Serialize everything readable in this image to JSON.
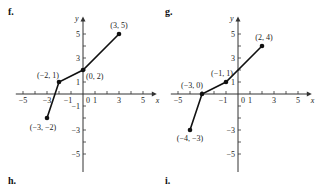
{
  "labels": {
    "f": "f.",
    "g": "g.",
    "h": "h.",
    "i": "i."
  },
  "chart_data": [
    {
      "type": "line",
      "title": "f.",
      "xlabel": "x",
      "ylabel": "y",
      "xlim": [
        -5,
        5
      ],
      "ylim": [
        -5,
        5
      ],
      "x_ticks": [
        -5,
        -3,
        -1,
        0,
        1,
        3,
        5
      ],
      "y_ticks": [
        -5,
        -3,
        -1,
        1,
        3,
        5
      ],
      "grid": false,
      "points": [
        [
          -3,
          -2
        ],
        [
          -2,
          1
        ],
        [
          0,
          2
        ],
        [
          3,
          5
        ]
      ],
      "point_labels": [
        "(−3, −2)",
        "(−2, 1)",
        "(0, 2)",
        "(3, 5)"
      ]
    },
    {
      "type": "line",
      "title": "g.",
      "xlabel": "x",
      "ylabel": "y",
      "xlim": [
        -5,
        5
      ],
      "ylim": [
        -5,
        5
      ],
      "x_ticks": [
        -5,
        -1,
        0,
        1,
        3,
        5
      ],
      "y_ticks": [
        -5,
        -3,
        1,
        3,
        5
      ],
      "grid": false,
      "points": [
        [
          -4,
          -3
        ],
        [
          -3,
          0
        ],
        [
          -1,
          1
        ],
        [
          2,
          4
        ]
      ],
      "point_labels": [
        "(−4, −3)",
        "(−3, 0)",
        "(−1, 1)",
        "(2, 4)"
      ]
    }
  ]
}
